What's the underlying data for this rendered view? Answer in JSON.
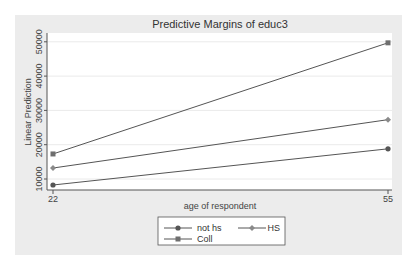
{
  "chart_data": {
    "type": "line",
    "title": "Predictive Margins of educ3",
    "xlabel": "age of respondent",
    "ylabel": "Linear Prediction",
    "x": [
      22,
      55
    ],
    "x_ticks": [
      "22",
      "55"
    ],
    "y_ticks": [
      "10000",
      "20000",
      "30000",
      "40000",
      "50000"
    ],
    "y_tick_values": [
      10000,
      20000,
      30000,
      40000,
      50000
    ],
    "xlim": [
      22,
      55
    ],
    "ylim": [
      10000,
      50000
    ],
    "grid": true,
    "legend_position": "bottom",
    "series": [
      {
        "name": "not hs",
        "values": [
          8250,
          18800
        ],
        "marker": "circle",
        "color": "#555555"
      },
      {
        "name": "HS",
        "values": [
          13200,
          27300
        ],
        "marker": "diamond",
        "color": "#8a8a8a"
      },
      {
        "name": "Coll",
        "values": [
          17300,
          49700
        ],
        "marker": "square",
        "color": "#6e6e6e"
      }
    ]
  },
  "colors": {
    "background": "#ececec",
    "plot_area": "#ffffff",
    "grid": "#eaeaea",
    "axis": "#555555"
  }
}
